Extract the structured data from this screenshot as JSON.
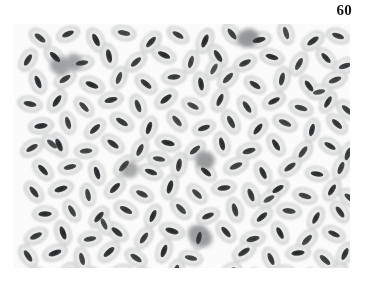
{
  "figure": {
    "number_label": "60",
    "caption": "",
    "kind": "light-micrograph",
    "panel": {
      "x": 14,
      "y": 24,
      "width": 336,
      "height": 244
    }
  },
  "colors": {
    "page_background": "#ffffff",
    "panel_background": "#fbfbfb",
    "label_text": "#17181a",
    "cell_body_light": "#eceded",
    "cell_body_mid": "#dcdddd",
    "cell_body_edge": "#c9cacb",
    "nucleus_dark": "#3a3c3e",
    "nucleus_core": "#232527",
    "leukocyte_dark": "#7e8183"
  },
  "micrograph": {
    "background": "#fbfbfb",
    "cell_count": 181,
    "leukocyte_count": 6,
    "cell_body": {
      "radius_x": 12.6,
      "radius_y": 7.9,
      "fill": "#e6e7e7",
      "edge": "#cdcecf"
    },
    "nucleus": {
      "radius_x": 6.6,
      "radius_y": 2.7,
      "fill": "#333537"
    },
    "erythrocytes": [
      {
        "x": 26,
        "y": 14,
        "a": 38,
        "s": 1.0,
        "d": 0.9
      },
      {
        "x": 54,
        "y": 10,
        "a": -22,
        "s": 0.96,
        "d": 0.95
      },
      {
        "x": 82,
        "y": 16,
        "a": 64,
        "s": 1.04,
        "d": 1.0
      },
      {
        "x": 110,
        "y": 9,
        "a": 12,
        "s": 0.98,
        "d": 0.88
      },
      {
        "x": 137,
        "y": 18,
        "a": -48,
        "s": 1.02,
        "d": 0.96
      },
      {
        "x": 164,
        "y": 11,
        "a": 30,
        "s": 0.95,
        "d": 0.92
      },
      {
        "x": 191,
        "y": 17,
        "a": -68,
        "s": 1.05,
        "d": 1.0
      },
      {
        "x": 218,
        "y": 10,
        "a": 52,
        "s": 0.99,
        "d": 0.9
      },
      {
        "x": 245,
        "y": 16,
        "a": -14,
        "s": 1.01,
        "d": 0.98
      },
      {
        "x": 272,
        "y": 9,
        "a": 72,
        "s": 0.97,
        "d": 0.86
      },
      {
        "x": 299,
        "y": 17,
        "a": -36,
        "s": 1.03,
        "d": 0.97
      },
      {
        "x": 324,
        "y": 12,
        "a": 20,
        "s": 0.96,
        "d": 0.93
      },
      {
        "x": 14,
        "y": 36,
        "a": -58,
        "s": 1.0,
        "d": 0.94
      },
      {
        "x": 41,
        "y": 33,
        "a": 44,
        "s": 1.02,
        "d": 1.0
      },
      {
        "x": 68,
        "y": 39,
        "a": -10,
        "s": 0.97,
        "d": 0.9
      },
      {
        "x": 95,
        "y": 32,
        "a": 78,
        "s": 1.04,
        "d": 0.98
      },
      {
        "x": 122,
        "y": 38,
        "a": -42,
        "s": 0.99,
        "d": 0.92
      },
      {
        "x": 150,
        "y": 31,
        "a": 26,
        "s": 1.01,
        "d": 1.0
      },
      {
        "x": 177,
        "y": 38,
        "a": -74,
        "s": 0.96,
        "d": 0.89
      },
      {
        "x": 204,
        "y": 32,
        "a": 58,
        "s": 1.03,
        "d": 0.96
      },
      {
        "x": 231,
        "y": 39,
        "a": -26,
        "s": 0.98,
        "d": 0.94
      },
      {
        "x": 258,
        "y": 33,
        "a": 16,
        "s": 1.0,
        "d": 1.0
      },
      {
        "x": 285,
        "y": 40,
        "a": -62,
        "s": 1.02,
        "d": 0.91
      },
      {
        "x": 312,
        "y": 34,
        "a": 48,
        "s": 0.97,
        "d": 0.97
      },
      {
        "x": 331,
        "y": 42,
        "a": -18,
        "s": 0.99,
        "d": 0.93
      },
      {
        "x": 24,
        "y": 58,
        "a": 68,
        "s": 1.01,
        "d": 0.99
      },
      {
        "x": 51,
        "y": 55,
        "a": -34,
        "s": 0.98,
        "d": 0.92
      },
      {
        "x": 78,
        "y": 61,
        "a": 22,
        "s": 1.04,
        "d": 1.0
      },
      {
        "x": 105,
        "y": 54,
        "a": -70,
        "s": 0.96,
        "d": 0.88
      },
      {
        "x": 132,
        "y": 60,
        "a": 40,
        "s": 1.02,
        "d": 0.96
      },
      {
        "x": 160,
        "y": 53,
        "a": -6,
        "s": 0.99,
        "d": 0.94
      },
      {
        "x": 187,
        "y": 60,
        "a": 80,
        "s": 1.0,
        "d": 1.0
      },
      {
        "x": 214,
        "y": 54,
        "a": -46,
        "s": 1.03,
        "d": 0.9
      },
      {
        "x": 241,
        "y": 61,
        "a": 34,
        "s": 0.97,
        "d": 0.97
      },
      {
        "x": 268,
        "y": 55,
        "a": -78,
        "s": 1.01,
        "d": 0.93
      },
      {
        "x": 295,
        "y": 62,
        "a": 54,
        "s": 0.98,
        "d": 0.99
      },
      {
        "x": 321,
        "y": 56,
        "a": -22,
        "s": 1.02,
        "d": 0.91
      },
      {
        "x": 16,
        "y": 80,
        "a": 12,
        "s": 1.0,
        "d": 0.95
      },
      {
        "x": 43,
        "y": 77,
        "a": -56,
        "s": 1.03,
        "d": 1.0
      },
      {
        "x": 70,
        "y": 83,
        "a": 46,
        "s": 0.96,
        "d": 0.89
      },
      {
        "x": 97,
        "y": 76,
        "a": -14,
        "s": 1.01,
        "d": 0.97
      },
      {
        "x": 124,
        "y": 82,
        "a": 70,
        "s": 0.99,
        "d": 0.93
      },
      {
        "x": 152,
        "y": 75,
        "a": -38,
        "s": 1.04,
        "d": 1.0
      },
      {
        "x": 179,
        "y": 82,
        "a": 28,
        "s": 0.97,
        "d": 0.88
      },
      {
        "x": 206,
        "y": 76,
        "a": -66,
        "s": 1.0,
        "d": 0.96
      },
      {
        "x": 233,
        "y": 83,
        "a": 56,
        "s": 1.02,
        "d": 0.94
      },
      {
        "x": 260,
        "y": 77,
        "a": -28,
        "s": 0.98,
        "d": 0.99
      },
      {
        "x": 287,
        "y": 84,
        "a": 18,
        "s": 1.01,
        "d": 0.9
      },
      {
        "x": 314,
        "y": 78,
        "a": -60,
        "s": 0.96,
        "d": 0.98
      },
      {
        "x": 333,
        "y": 86,
        "a": 42,
        "s": 1.0,
        "d": 0.92
      },
      {
        "x": 27,
        "y": 102,
        "a": -8,
        "s": 1.02,
        "d": 1.0
      },
      {
        "x": 54,
        "y": 99,
        "a": 74,
        "s": 0.97,
        "d": 0.91
      },
      {
        "x": 81,
        "y": 105,
        "a": -44,
        "s": 1.0,
        "d": 0.97
      },
      {
        "x": 108,
        "y": 98,
        "a": 32,
        "s": 1.03,
        "d": 0.94
      },
      {
        "x": 135,
        "y": 104,
        "a": -72,
        "s": 0.98,
        "d": 1.0
      },
      {
        "x": 163,
        "y": 97,
        "a": 50,
        "s": 1.01,
        "d": 0.88
      },
      {
        "x": 190,
        "y": 104,
        "a": -20,
        "s": 0.96,
        "d": 0.96
      },
      {
        "x": 217,
        "y": 98,
        "a": 62,
        "s": 1.04,
        "d": 0.93
      },
      {
        "x": 244,
        "y": 105,
        "a": -52,
        "s": 0.99,
        "d": 0.99
      },
      {
        "x": 271,
        "y": 99,
        "a": 24,
        "s": 1.02,
        "d": 0.9
      },
      {
        "x": 298,
        "y": 106,
        "a": -76,
        "s": 0.97,
        "d": 0.98
      },
      {
        "x": 323,
        "y": 100,
        "a": 44,
        "s": 1.0,
        "d": 0.95
      },
      {
        "x": 18,
        "y": 124,
        "a": -30,
        "s": 0.99,
        "d": 0.93
      },
      {
        "x": 45,
        "y": 121,
        "a": 66,
        "s": 1.03,
        "d": 1.0
      },
      {
        "x": 72,
        "y": 127,
        "a": -4,
        "s": 0.96,
        "d": 0.89
      },
      {
        "x": 99,
        "y": 120,
        "a": 36,
        "s": 1.01,
        "d": 0.97
      },
      {
        "x": 126,
        "y": 126,
        "a": -64,
        "s": 0.98,
        "d": 0.92
      },
      {
        "x": 154,
        "y": 119,
        "a": 14,
        "s": 1.04,
        "d": 1.0
      },
      {
        "x": 181,
        "y": 126,
        "a": -40,
        "s": 0.97,
        "d": 0.91
      },
      {
        "x": 208,
        "y": 120,
        "a": 76,
        "s": 1.0,
        "d": 0.98
      },
      {
        "x": 235,
        "y": 127,
        "a": -16,
        "s": 1.02,
        "d": 0.94
      },
      {
        "x": 262,
        "y": 121,
        "a": 58,
        "s": 0.98,
        "d": 1.0
      },
      {
        "x": 289,
        "y": 128,
        "a": -54,
        "s": 1.01,
        "d": 0.89
      },
      {
        "x": 316,
        "y": 122,
        "a": 30,
        "s": 0.96,
        "d": 0.96
      },
      {
        "x": 334,
        "y": 130,
        "a": -70,
        "s": 1.0,
        "d": 0.93
      },
      {
        "x": 29,
        "y": 146,
        "a": 48,
        "s": 1.02,
        "d": 0.99
      },
      {
        "x": 56,
        "y": 143,
        "a": -12,
        "s": 0.97,
        "d": 0.92
      },
      {
        "x": 83,
        "y": 149,
        "a": 72,
        "s": 1.0,
        "d": 1.0
      },
      {
        "x": 110,
        "y": 142,
        "a": -48,
        "s": 1.03,
        "d": 0.88
      },
      {
        "x": 137,
        "y": 148,
        "a": 20,
        "s": 0.98,
        "d": 0.97
      },
      {
        "x": 165,
        "y": 141,
        "a": -80,
        "s": 1.01,
        "d": 0.94
      },
      {
        "x": 192,
        "y": 148,
        "a": 40,
        "s": 0.96,
        "d": 1.0
      },
      {
        "x": 222,
        "y": 142,
        "a": -24,
        "s": 1.04,
        "d": 0.9
      },
      {
        "x": 249,
        "y": 149,
        "a": 64,
        "s": 0.99,
        "d": 0.98
      },
      {
        "x": 276,
        "y": 143,
        "a": -36,
        "s": 1.02,
        "d": 0.93
      },
      {
        "x": 303,
        "y": 150,
        "a": 10,
        "s": 0.97,
        "d": 0.99
      },
      {
        "x": 327,
        "y": 144,
        "a": -68,
        "s": 1.0,
        "d": 0.91
      },
      {
        "x": 20,
        "y": 168,
        "a": 52,
        "s": 0.99,
        "d": 0.96
      },
      {
        "x": 47,
        "y": 165,
        "a": -18,
        "s": 1.03,
        "d": 1.0
      },
      {
        "x": 74,
        "y": 171,
        "a": 78,
        "s": 0.96,
        "d": 0.9
      },
      {
        "x": 101,
        "y": 164,
        "a": -44,
        "s": 1.01,
        "d": 0.98
      },
      {
        "x": 128,
        "y": 170,
        "a": 26,
        "s": 0.98,
        "d": 0.93
      },
      {
        "x": 156,
        "y": 163,
        "a": -74,
        "s": 1.04,
        "d": 1.0
      },
      {
        "x": 183,
        "y": 170,
        "a": 44,
        "s": 0.97,
        "d": 0.89
      },
      {
        "x": 210,
        "y": 164,
        "a": -8,
        "s": 1.0,
        "d": 0.97
      },
      {
        "x": 237,
        "y": 171,
        "a": 68,
        "s": 1.02,
        "d": 0.94
      },
      {
        "x": 264,
        "y": 165,
        "a": -32,
        "s": 0.98,
        "d": 1.0
      },
      {
        "x": 291,
        "y": 172,
        "a": 16,
        "s": 1.01,
        "d": 0.9
      },
      {
        "x": 318,
        "y": 166,
        "a": -58,
        "s": 0.96,
        "d": 0.98
      },
      {
        "x": 336,
        "y": 174,
        "a": 36,
        "s": 1.0,
        "d": 0.92
      },
      {
        "x": 31,
        "y": 190,
        "a": -2,
        "s": 1.02,
        "d": 1.0
      },
      {
        "x": 58,
        "y": 187,
        "a": 60,
        "s": 0.97,
        "d": 0.91
      },
      {
        "x": 85,
        "y": 193,
        "a": -50,
        "s": 1.0,
        "d": 0.97
      },
      {
        "x": 112,
        "y": 186,
        "a": 28,
        "s": 1.03,
        "d": 0.94
      },
      {
        "x": 139,
        "y": 192,
        "a": -66,
        "s": 0.98,
        "d": 1.0
      },
      {
        "x": 167,
        "y": 185,
        "a": 46,
        "s": 1.01,
        "d": 0.88
      },
      {
        "x": 194,
        "y": 192,
        "a": -22,
        "s": 0.96,
        "d": 0.96
      },
      {
        "x": 221,
        "y": 186,
        "a": 74,
        "s": 1.04,
        "d": 0.93
      },
      {
        "x": 248,
        "y": 193,
        "a": -40,
        "s": 0.99,
        "d": 0.99
      },
      {
        "x": 275,
        "y": 187,
        "a": 8,
        "s": 1.02,
        "d": 0.9
      },
      {
        "x": 302,
        "y": 194,
        "a": -62,
        "s": 0.97,
        "d": 0.98
      },
      {
        "x": 326,
        "y": 188,
        "a": 54,
        "s": 1.0,
        "d": 0.95
      },
      {
        "x": 22,
        "y": 212,
        "a": -26,
        "s": 0.99,
        "d": 0.93
      },
      {
        "x": 49,
        "y": 209,
        "a": 70,
        "s": 1.03,
        "d": 1.0
      },
      {
        "x": 76,
        "y": 215,
        "a": -10,
        "s": 0.96,
        "d": 0.89
      },
      {
        "x": 103,
        "y": 208,
        "a": 38,
        "s": 1.01,
        "d": 0.97
      },
      {
        "x": 130,
        "y": 214,
        "a": -56,
        "s": 0.98,
        "d": 0.92
      },
      {
        "x": 158,
        "y": 207,
        "a": 18,
        "s": 1.04,
        "d": 1.0
      },
      {
        "x": 185,
        "y": 214,
        "a": -78,
        "s": 0.97,
        "d": 0.91
      },
      {
        "x": 212,
        "y": 208,
        "a": 50,
        "s": 1.0,
        "d": 0.98
      },
      {
        "x": 239,
        "y": 215,
        "a": -14,
        "s": 1.02,
        "d": 0.94
      },
      {
        "x": 266,
        "y": 209,
        "a": 62,
        "s": 0.98,
        "d": 1.0
      },
      {
        "x": 293,
        "y": 216,
        "a": -46,
        "s": 1.01,
        "d": 0.89
      },
      {
        "x": 320,
        "y": 210,
        "a": 24,
        "s": 0.96,
        "d": 0.96
      },
      {
        "x": 14,
        "y": 232,
        "a": 56,
        "s": 1.0,
        "d": 0.94
      },
      {
        "x": 41,
        "y": 229,
        "a": -20,
        "s": 1.02,
        "d": 1.0
      },
      {
        "x": 68,
        "y": 235,
        "a": 76,
        "s": 0.97,
        "d": 0.9
      },
      {
        "x": 95,
        "y": 228,
        "a": -42,
        "s": 1.04,
        "d": 0.98
      },
      {
        "x": 122,
        "y": 234,
        "a": 34,
        "s": 0.99,
        "d": 0.92
      },
      {
        "x": 150,
        "y": 227,
        "a": -70,
        "s": 1.01,
        "d": 1.0
      },
      {
        "x": 177,
        "y": 234,
        "a": 12,
        "s": 0.96,
        "d": 0.89
      },
      {
        "x": 230,
        "y": 228,
        "a": -34,
        "s": 1.03,
        "d": 0.96
      },
      {
        "x": 257,
        "y": 235,
        "a": 66,
        "s": 0.98,
        "d": 0.94
      },
      {
        "x": 284,
        "y": 229,
        "a": -6,
        "s": 1.0,
        "d": 1.0
      },
      {
        "x": 311,
        "y": 236,
        "a": 42,
        "s": 1.02,
        "d": 0.91
      },
      {
        "x": 331,
        "y": 230,
        "a": -64,
        "s": 0.97,
        "d": 0.97
      },
      {
        "x": 26,
        "y": 252,
        "a": 30,
        "s": 1.01,
        "d": 0.99
      },
      {
        "x": 53,
        "y": 249,
        "a": -52,
        "s": 0.98,
        "d": 0.92
      },
      {
        "x": 80,
        "y": 255,
        "a": 72,
        "s": 1.04,
        "d": 1.0
      },
      {
        "x": 107,
        "y": 248,
        "a": -16,
        "s": 0.96,
        "d": 0.88
      },
      {
        "x": 134,
        "y": 254,
        "a": 48,
        "s": 1.02,
        "d": 0.96
      },
      {
        "x": 162,
        "y": 247,
        "a": -72,
        "s": 0.99,
        "d": 0.94
      },
      {
        "x": 189,
        "y": 254,
        "a": 22,
        "s": 1.0,
        "d": 1.0
      },
      {
        "x": 216,
        "y": 248,
        "a": -38,
        "s": 1.03,
        "d": 0.9
      },
      {
        "x": 243,
        "y": 255,
        "a": 60,
        "s": 0.97,
        "d": 0.97
      },
      {
        "x": 270,
        "y": 249,
        "a": -2,
        "s": 1.01,
        "d": 0.93
      },
      {
        "x": 297,
        "y": 256,
        "a": 80,
        "s": 0.98,
        "d": 0.99
      },
      {
        "x": 323,
        "y": 250,
        "a": -48,
        "s": 1.02,
        "d": 0.91
      },
      {
        "x": 38,
        "y": 120,
        "a": 40,
        "s": 0.94,
        "d": 0.86
      },
      {
        "x": 200,
        "y": 45,
        "a": -60,
        "s": 0.93,
        "d": 0.84
      },
      {
        "x": 145,
        "y": 135,
        "a": 10,
        "s": 0.95,
        "d": 0.88
      },
      {
        "x": 255,
        "y": 175,
        "a": -30,
        "s": 0.94,
        "d": 0.85
      },
      {
        "x": 90,
        "y": 200,
        "a": 64,
        "s": 0.93,
        "d": 0.87
      },
      {
        "x": 305,
        "y": 68,
        "a": -12,
        "s": 0.95,
        "d": 0.84
      }
    ],
    "leukocytes": [
      {
        "x": 46,
        "y": 42,
        "rx": 10,
        "ry": 9,
        "a": 20,
        "tone": "#9a9c9e"
      },
      {
        "x": 234,
        "y": 14,
        "rx": 11,
        "ry": 9,
        "a": -25,
        "tone": "#8c8f91"
      },
      {
        "x": 191,
        "y": 136,
        "rx": 10,
        "ry": 9,
        "a": 10,
        "tone": "#8f9294"
      },
      {
        "x": 186,
        "y": 212,
        "rx": 13,
        "ry": 10,
        "a": 35,
        "tone": "#949698"
      },
      {
        "x": 116,
        "y": 146,
        "rx": 9,
        "ry": 8,
        "a": -15,
        "tone": "#a0a2a4"
      },
      {
        "x": 60,
        "y": 38,
        "rx": 9,
        "ry": 8,
        "a": 45,
        "tone": "#9d9fa1"
      }
    ]
  }
}
